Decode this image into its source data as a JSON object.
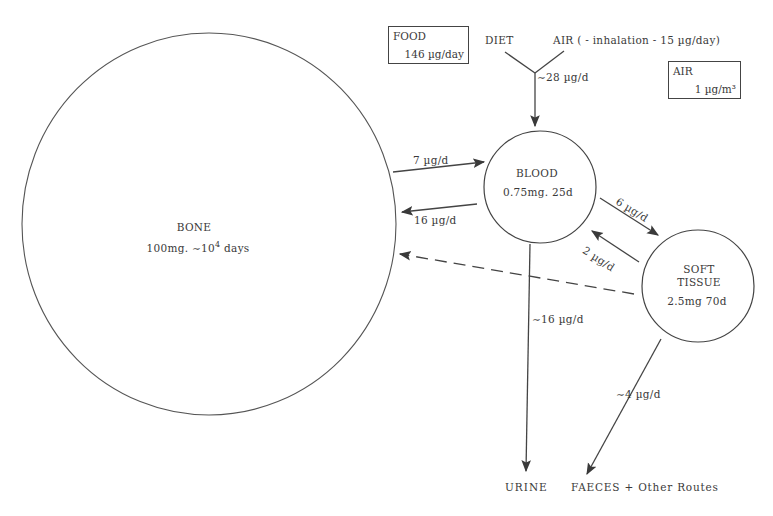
{
  "compartments": {
    "bone": {
      "name": "BONE",
      "detail_prefix": "100mg. ∼10",
      "detail_exp": "4",
      "detail_suffix": " days"
    },
    "blood": {
      "name": "BLOOD",
      "detail": "0.75mg. 25d"
    },
    "soft_tissue": {
      "name_line1": "SOFT",
      "name_line2": "TISSUE",
      "detail": "2.5mg 70d"
    }
  },
  "sources": {
    "food_box": {
      "title": "FOOD",
      "value": "146 µg/day"
    },
    "air_box": {
      "title": "AIR",
      "value": "1 µg/m³"
    },
    "diet_label": "DIET",
    "air_label": "AIR ( - inhalation - 15 µg/day)"
  },
  "flows": {
    "intake": "∼28 µg/d",
    "blood_to_bone": "7 µg/d",
    "bone_to_blood": "16 µg/d",
    "blood_to_soft": "6 µg/d",
    "soft_to_blood": "2 µg/d",
    "blood_to_urine": "∼16 µg/d",
    "soft_to_faeces": "∼4 µg/d"
  },
  "sinks": {
    "urine": "URINE",
    "faeces": "FAECES + Other Routes"
  },
  "colors": {
    "stroke": "#444444",
    "text": "#3a3a3a",
    "background": "#ffffff"
  }
}
